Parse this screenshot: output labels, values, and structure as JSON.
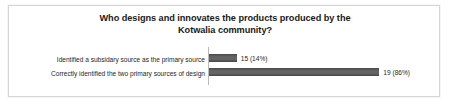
{
  "chart_data": {
    "type": "bar",
    "orientation": "horizontal",
    "title": "Who designs and innovates the products produced by the Kotwalia community?",
    "title_line_1": "Who designs and innovates the products produced by the",
    "title_line_2": "Kotwalia community?",
    "categories": [
      "Identified a subsidary source as the primary source",
      "Correctly identified the two primary sources of design"
    ],
    "values": [
      15,
      19
    ],
    "percentages": [
      14,
      86
    ],
    "data_labels": [
      "15 (14%)",
      "19 (86%)"
    ],
    "bar_lengths_percent": [
      14,
      86
    ],
    "xlabel": "",
    "ylabel": "",
    "xlim": [
      0,
      100
    ],
    "grid": false,
    "legend": false,
    "series": [
      {
        "name": "Responses",
        "values": [
          15,
          19
        ],
        "percentages": [
          14,
          86
        ],
        "labels": [
          "15 (14%)",
          "19 (86%)"
        ]
      }
    ],
    "colors": {
      "bar": "#5e5e5e",
      "bar_edge": "#4b4b4b",
      "axis": "#b9b9b9",
      "frame_border": "#d6d6d6",
      "background": "#ffffff",
      "text": "#1f1f1f",
      "title_text": "#1a1a1a"
    }
  }
}
